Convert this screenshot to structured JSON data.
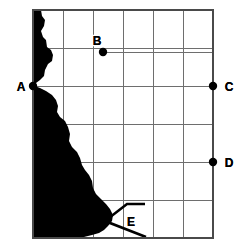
{
  "figure": {
    "type": "grid-map",
    "title": "",
    "background_color": "#ffffff",
    "land_color": "#000000",
    "grid_color": "#6e6e6e",
    "frame_color": "#4a4a4a"
  },
  "grid": {
    "columns": 6,
    "rows": 6,
    "x_lines": [
      33,
      63,
      93,
      123,
      153,
      183,
      213
    ],
    "y_lines": [
      10,
      48,
      86,
      124,
      162,
      200,
      238
    ],
    "left": 33,
    "right": 213,
    "top": 10,
    "bottom": 238
  },
  "points": [
    {
      "id": "A",
      "label": "A",
      "x": 33,
      "y": 86,
      "label_x": 21,
      "label_y": 91,
      "label_anchor": "middle"
    },
    {
      "id": "B",
      "label": "B",
      "x": 103,
      "y": 52,
      "label_x": 97,
      "label_y": 45,
      "label_anchor": "middle"
    },
    {
      "id": "C",
      "label": "C",
      "x": 213,
      "y": 86,
      "label_x": 229,
      "label_y": 91,
      "label_anchor": "middle"
    },
    {
      "id": "D",
      "label": "D",
      "x": 213,
      "y": 162,
      "label_x": 229,
      "label_y": 167,
      "label_anchor": "middle"
    },
    {
      "id": "E",
      "label": "E",
      "x": 131,
      "y": 221,
      "label_x": 131,
      "label_y": 226,
      "label_anchor": "middle"
    }
  ],
  "leader_lines": [
    {
      "from": "A",
      "to_x": 213,
      "y": 86
    },
    {
      "from": "B",
      "to_x": 213,
      "y": 52
    },
    {
      "from": "D",
      "to_x": 33,
      "y": 162
    }
  ],
  "inlet": {
    "name": "E",
    "description": "wedge-shaped inlet opening eastward",
    "path": "M 145 204 L 127 204 L 105 221 L 146 237"
  },
  "landmass": {
    "name": "coastline-silhouette",
    "path": "M 33 10 L 41 10 L 42 16 L 45 20 L 44 26 L 41 31 L 43 37 L 46 40 L 47 47 L 51 50 L 53 55 L 52 61 L 48 64 L 45 70 L 44 76 L 40 80 L 36 83 L 35 86 L 40 88 L 46 91 L 52 95 L 56 100 L 58 106 L 57 112 L 60 117 L 65 121 L 68 127 L 70 134 L 69 141 L 72 147 L 77 152 L 80 158 L 82 165 L 85 170 L 89 175 L 92 181 L 93 188 L 96 194 L 101 199 L 106 204 L 110 209 L 113 215 L 112 221 L 108 226 L 104 230 L 99 233 L 92 235 L 84 237 L 74 238 L 60 238 L 33 238 Z"
  },
  "colors": {
    "land": "#000000",
    "grid": "#6e6e6e",
    "frame": "#4a4a4a",
    "label": "#000000",
    "page": "#ffffff"
  }
}
